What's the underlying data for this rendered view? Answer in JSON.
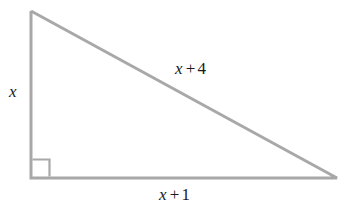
{
  "figure": {
    "type": "right-triangle-diagram",
    "background_color": "#ffffff",
    "stroke_color": "#a8a8a8",
    "stroke_width": 3,
    "text_color": "#1a1a1a",
    "vertices": {
      "apex": [
        31,
        11
      ],
      "right_angle_corner": [
        31,
        178
      ],
      "far_corner": [
        337,
        178
      ]
    },
    "right_angle_marker": {
      "present": true,
      "at_vertex": "right_angle_corner",
      "size": 17
    }
  },
  "labels": {
    "vertical_leg": {
      "variable": "x",
      "operator": "",
      "number": ""
    },
    "hypotenuse": {
      "variable": "x",
      "operator": "+",
      "number": "4"
    },
    "horizontal_leg": {
      "variable": "x",
      "operator": "+",
      "number": "1"
    }
  }
}
